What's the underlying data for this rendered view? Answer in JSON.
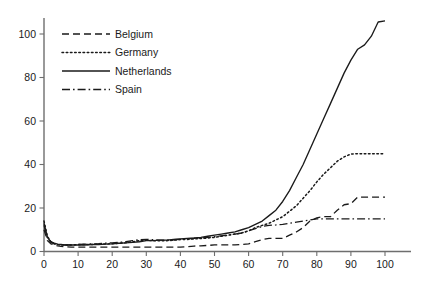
{
  "chart_data": {
    "type": "line",
    "title": "",
    "xlabel": "",
    "ylabel": "",
    "xlim": [
      0,
      104
    ],
    "ylim": [
      0,
      112
    ],
    "grid": false,
    "legend_position": "top-left",
    "xticks": [
      0,
      10,
      20,
      30,
      40,
      50,
      60,
      70,
      80,
      90,
      100
    ],
    "yticks": [
      0,
      20,
      40,
      60,
      80,
      100
    ],
    "xtick_labels": [
      "0",
      "10",
      "20",
      "30",
      "40",
      "50",
      "60",
      "70",
      "80",
      "90",
      "100"
    ],
    "ytick_labels": [
      "0",
      "20",
      "40",
      "60",
      "80",
      "100"
    ],
    "series": [
      {
        "name": "Belgium",
        "style": "dashed",
        "dash": "7,4",
        "color": "#1a1a1a",
        "x": [
          0,
          1,
          2,
          3,
          4,
          5,
          6,
          8,
          10,
          12,
          14,
          16,
          18,
          20,
          22,
          24,
          26,
          28,
          30,
          32,
          34,
          36,
          38,
          40,
          42,
          44,
          46,
          48,
          50,
          52,
          54,
          56,
          58,
          60,
          62,
          64,
          66,
          68,
          70,
          72,
          74,
          76,
          78,
          80,
          82,
          84,
          86,
          88,
          90,
          92,
          94,
          96,
          98,
          100
        ],
        "values": [
          10.0,
          5.0,
          3.5,
          3.0,
          2.6,
          2.4,
          2.2,
          2.0,
          2.0,
          2.0,
          2.0,
          2.0,
          2.0,
          2.0,
          2.0,
          2.0,
          2.0,
          2.0,
          2.0,
          2.0,
          2.0,
          2.0,
          2.0,
          2.0,
          2.2,
          2.5,
          2.6,
          2.8,
          3.0,
          3.0,
          3.0,
          3.0,
          3.2,
          3.5,
          4.5,
          5.5,
          6.0,
          6.0,
          6.0,
          7.5,
          9.0,
          11.0,
          14.0,
          15.5,
          16.0,
          16.0,
          19.0,
          21.5,
          22.0,
          25.0,
          25.0,
          25.0,
          25.0,
          25.0
        ]
      },
      {
        "name": "Germany",
        "style": "dotted",
        "dash": "1.6,2.6",
        "color": "#1a1a1a",
        "x": [
          0,
          1,
          2,
          3,
          4,
          5,
          6,
          8,
          10,
          12,
          14,
          16,
          18,
          20,
          22,
          24,
          26,
          28,
          30,
          32,
          34,
          36,
          38,
          40,
          42,
          44,
          46,
          48,
          50,
          52,
          54,
          56,
          58,
          60,
          62,
          64,
          66,
          68,
          70,
          72,
          74,
          76,
          78,
          80,
          82,
          84,
          86,
          88,
          90,
          92,
          94,
          96,
          98,
          100
        ],
        "values": [
          14.0,
          7.0,
          4.5,
          3.6,
          3.2,
          3.0,
          3.0,
          3.0,
          3.2,
          3.2,
          3.2,
          3.4,
          3.4,
          3.6,
          3.8,
          4.0,
          4.5,
          5.0,
          5.2,
          5.0,
          5.0,
          5.0,
          5.2,
          5.5,
          5.5,
          5.8,
          6.0,
          6.2,
          6.5,
          7.0,
          7.5,
          8.0,
          8.5,
          9.5,
          11.0,
          12.0,
          13.0,
          14.5,
          16.0,
          18.5,
          21.0,
          24.5,
          28.0,
          32.0,
          35.5,
          38.5,
          41.5,
          43.5,
          44.8,
          45.0,
          45.0,
          45.0,
          45.0,
          45.0
        ]
      },
      {
        "name": "Netherlands",
        "style": "solid",
        "dash": "none",
        "color": "#1a1a1a",
        "x": [
          0,
          1,
          2,
          3,
          4,
          5,
          6,
          8,
          10,
          12,
          14,
          16,
          18,
          20,
          22,
          24,
          26,
          28,
          30,
          32,
          34,
          36,
          38,
          40,
          42,
          44,
          46,
          48,
          50,
          52,
          54,
          56,
          58,
          60,
          62,
          64,
          66,
          68,
          70,
          72,
          74,
          76,
          78,
          80,
          82,
          84,
          86,
          88,
          90,
          92,
          94,
          96,
          98,
          100
        ],
        "values": [
          13.0,
          6.5,
          4.5,
          3.8,
          3.4,
          3.2,
          3.0,
          3.0,
          3.0,
          3.0,
          3.2,
          3.2,
          3.4,
          3.5,
          3.8,
          4.0,
          4.2,
          4.5,
          5.0,
          5.0,
          5.2,
          5.2,
          5.5,
          5.8,
          6.0,
          6.2,
          6.5,
          7.0,
          7.5,
          8.0,
          8.5,
          9.0,
          10.0,
          11.0,
          12.5,
          14.0,
          16.5,
          19.0,
          23.0,
          28.0,
          34.0,
          40.0,
          47.0,
          54.0,
          61.0,
          68.0,
          75.0,
          82.0,
          88.0,
          93.0,
          95.0,
          99.0,
          105.5,
          106.0
        ]
      },
      {
        "name": "Spain",
        "style": "dashdot",
        "dash": "8,3,1.6,3",
        "color": "#1a1a1a",
        "x": [
          0,
          1,
          2,
          3,
          4,
          5,
          6,
          8,
          10,
          12,
          14,
          16,
          18,
          20,
          22,
          24,
          26,
          28,
          30,
          32,
          34,
          36,
          38,
          40,
          42,
          44,
          46,
          48,
          50,
          52,
          54,
          56,
          58,
          60,
          62,
          64,
          66,
          68,
          70,
          72,
          74,
          76,
          78,
          80,
          82,
          84,
          86,
          88,
          90,
          92,
          94,
          96,
          98,
          100
        ],
        "values": [
          12.0,
          6.0,
          4.2,
          3.5,
          3.2,
          3.0,
          3.0,
          3.0,
          3.2,
          3.4,
          3.5,
          3.6,
          3.8,
          4.0,
          4.2,
          4.5,
          5.0,
          5.4,
          5.6,
          5.4,
          5.2,
          5.2,
          5.4,
          5.6,
          5.8,
          6.0,
          6.2,
          6.5,
          6.8,
          7.2,
          7.6,
          8.0,
          8.5,
          9.5,
          10.5,
          11.5,
          12.0,
          12.2,
          12.5,
          13.0,
          13.5,
          14.0,
          14.5,
          15.0,
          15.0,
          15.0,
          15.0,
          15.0,
          15.0,
          15.0,
          15.0,
          15.0,
          15.0,
          15.0
        ]
      }
    ]
  },
  "legend": {
    "entries": [
      {
        "label": "Belgium"
      },
      {
        "label": "Germany"
      },
      {
        "label": "Netherlands"
      },
      {
        "label": "Spain"
      }
    ]
  },
  "colors": {
    "ink": "#1a1a1a",
    "axis": "#6e6e6e",
    "background": "#ffffff"
  }
}
